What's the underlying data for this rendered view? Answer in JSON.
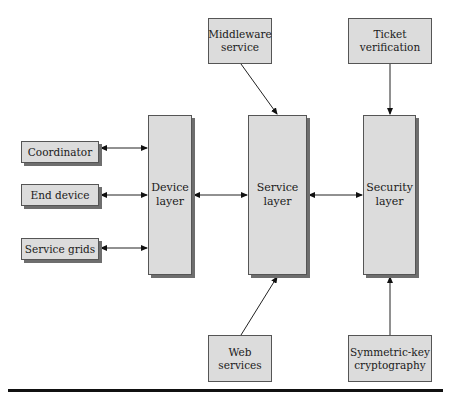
{
  "diagram": {
    "top_boxes": [
      {
        "id": "middleware",
        "label_line1": "Middleware",
        "label_line2": "service"
      },
      {
        "id": "ticket",
        "label_line1": "Ticket",
        "label_line2": "verification"
      }
    ],
    "left_boxes": [
      {
        "id": "coordinator",
        "label": "Coordinator"
      },
      {
        "id": "end_device",
        "label": "End device"
      },
      {
        "id": "service_grids",
        "label": "Service grids"
      }
    ],
    "layers": [
      {
        "id": "device",
        "label_line1": "Device",
        "label_line2": "layer"
      },
      {
        "id": "service",
        "label_line1": "Service",
        "label_line2": "layer"
      },
      {
        "id": "security",
        "label_line1": "Security",
        "label_line2": "layer"
      }
    ],
    "bottom_boxes": [
      {
        "id": "web",
        "label_line1": "Web",
        "label_line2": "services"
      },
      {
        "id": "crypto",
        "label_line1": "Symmetric-key",
        "label_line2": "cryptography"
      }
    ],
    "connections": [
      {
        "from": "Coordinator",
        "to": "Device layer",
        "type": "bidirectional"
      },
      {
        "from": "End device",
        "to": "Device layer",
        "type": "bidirectional"
      },
      {
        "from": "Service grids",
        "to": "Device layer",
        "type": "bidirectional"
      },
      {
        "from": "Device layer",
        "to": "Service layer",
        "type": "bidirectional"
      },
      {
        "from": "Service layer",
        "to": "Security layer",
        "type": "bidirectional"
      },
      {
        "from": "Middleware service",
        "to": "Service layer",
        "type": "directed"
      },
      {
        "from": "Web services",
        "to": "Service layer",
        "type": "directed"
      },
      {
        "from": "Ticket verification",
        "to": "Security layer",
        "type": "directed"
      },
      {
        "from": "Symmetric-key cryptography",
        "to": "Security layer",
        "type": "directed"
      }
    ]
  }
}
